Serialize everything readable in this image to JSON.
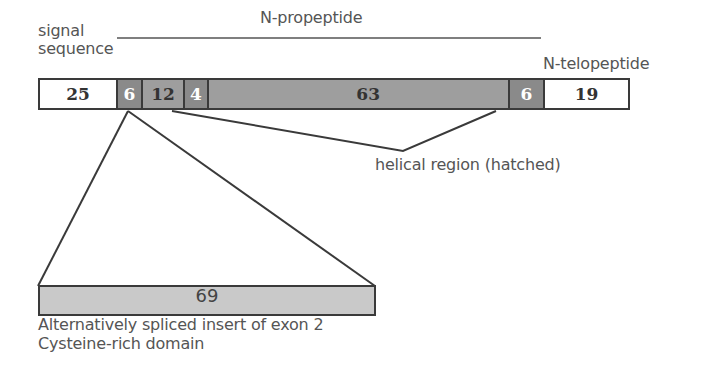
{
  "labels": {
    "signal_line1": "signal",
    "signal_line2": "sequence",
    "n_propeptide": "N-propeptide",
    "n_telopeptide": "N-telopeptide",
    "helical": "helical region (hatched)",
    "insert_line1": "Alternatively spliced insert of exon 2",
    "insert_line2": "Cysteine-rich domain"
  },
  "segments": [
    {
      "value": "25",
      "style": "white"
    },
    {
      "value": "6",
      "style": "dark"
    },
    {
      "value": "12",
      "style": "mid"
    },
    {
      "value": "4",
      "style": "dark"
    },
    {
      "value": "63",
      "style": "mid"
    },
    {
      "value": "6",
      "style": "dark"
    },
    {
      "value": "19",
      "style": "white"
    }
  ],
  "insert": {
    "value": "69"
  },
  "colors": {
    "outline": "#3a3a3a",
    "white_segment": "#ffffff",
    "dark_segment": "#8a8a8a",
    "mid_segment": "#9e9e9e",
    "insert_fill": "#c9c9c9",
    "text": "#555555"
  }
}
